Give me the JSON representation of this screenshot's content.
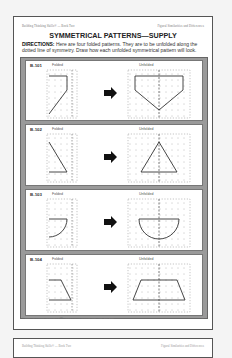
{
  "header": {
    "left": "Building Thinking Skills® — Book Two",
    "right": "Figural Similarities and Differences"
  },
  "title": "SYMMETRICAL PATTERNS—SUPPLY",
  "directions": {
    "label": "DIRECTIONS:",
    "text": " Here are four folded patterns. They are to be unfolded along the dotted line of symmetry. Draw how each unfolded symmetrical pattern will look."
  },
  "panels": [
    {
      "id": "B-101",
      "folded_label": "Folded",
      "unfolded_label": "Unfolded",
      "shape": "pentagon-home-plate"
    },
    {
      "id": "B-102",
      "folded_label": "Folded",
      "unfolded_label": "Unfolded",
      "shape": "triangle"
    },
    {
      "id": "B-103",
      "folded_label": "Folded",
      "unfolded_label": "Unfolded",
      "shape": "semicircle"
    },
    {
      "id": "B-104",
      "folded_label": "Folded",
      "unfolded_label": "Unfolded",
      "shape": "trapezoid"
    }
  ],
  "icons": {
    "arrow": "right-arrow-icon"
  },
  "footer": {
    "copyright": "© 2008 The Critical Thinking Co.™ • www.CriticalThinking.com • 800-458-4849",
    "page_number": "49"
  },
  "next_page": {
    "header_left": "Building Thinking Skills® — Book Two",
    "header_right": "Figural Similarities and Differences"
  }
}
